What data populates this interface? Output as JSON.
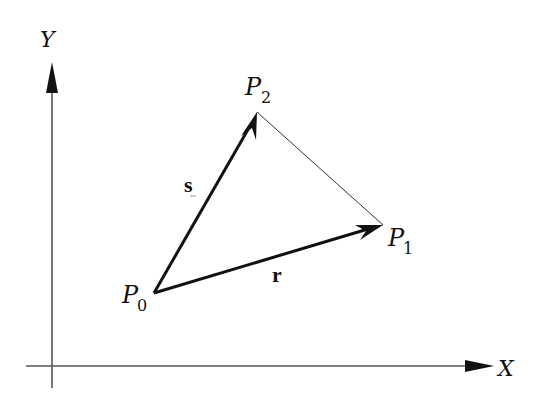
{
  "diagram": {
    "axes": {
      "x_label": "X",
      "y_label": "Y",
      "color": "#555555"
    },
    "points": [
      {
        "name": "P",
        "sub": "0",
        "x": 154,
        "y": 293
      },
      {
        "name": "P",
        "sub": "1",
        "x": 383,
        "y": 225
      },
      {
        "name": "P",
        "sub": "2",
        "x": 257,
        "y": 112
      }
    ],
    "vectors": [
      {
        "label": "r",
        "from": "P0",
        "to": "P1"
      },
      {
        "label": "s",
        "from": "P0",
        "to": "P2"
      }
    ],
    "edge": {
      "from": "P1",
      "to": "P2",
      "style": "thin"
    },
    "colors": {
      "ink": "#111111",
      "axis": "#555555",
      "background": "#ffffff"
    }
  }
}
